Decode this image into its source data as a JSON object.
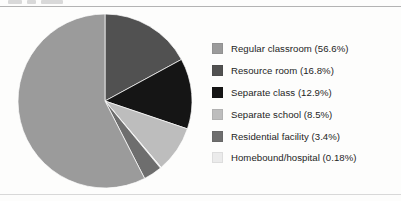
{
  "figure": {
    "background_color": "#fdfdfc",
    "rule_color": "#b3b3b3"
  },
  "chart_data": {
    "type": "pie",
    "title": "",
    "subtitle": "",
    "xlabel": "",
    "ylabel": "",
    "grid": false,
    "legend_position": "right",
    "start_angle_deg": 0,
    "direction": "clockwise",
    "categories": [
      "Regular classroom",
      "Resource room",
      "Separate class",
      "Separate school",
      "Residential facility",
      "Homebound/hospital"
    ],
    "values": [
      56.6,
      16.8,
      12.9,
      8.5,
      3.4,
      0.18
    ],
    "value_unit": "%",
    "colors": [
      "#9b9b9b",
      "#515151",
      "#151515",
      "#bdbdbd",
      "#6e6e6e",
      "#ebebeb"
    ],
    "slices": [
      {
        "label": "Regular classroom",
        "value": 56.6,
        "display": "56.6%",
        "color": "#9b9b9b",
        "draw_order": 6
      },
      {
        "label": "Resource room",
        "value": 16.8,
        "display": "16.8%",
        "color": "#515151",
        "draw_order": 1
      },
      {
        "label": "Separate class",
        "value": 12.9,
        "display": "12.9%",
        "color": "#151515",
        "draw_order": 2
      },
      {
        "label": "Separate school",
        "value": 8.5,
        "display": "8.5%",
        "color": "#bdbdbd",
        "draw_order": 3
      },
      {
        "label": "Homebound/hospital",
        "value": 0.18,
        "display": "0.18%",
        "color": "#ebebeb",
        "draw_order": 4
      },
      {
        "label": "Residential facility",
        "value": 3.4,
        "display": "3.4%",
        "color": "#6e6e6e",
        "draw_order": 5
      }
    ]
  },
  "legend": {
    "items": [
      {
        "label": "Regular classroom (56.6%)",
        "color": "#9b9b9b"
      },
      {
        "label": "Resource room (16.8%)",
        "color": "#515151"
      },
      {
        "label": "Separate class (12.9%)",
        "color": "#151515"
      },
      {
        "label": "Separate school (8.5%)",
        "color": "#bdbdbd"
      },
      {
        "label": "Residential facility (3.4%)",
        "color": "#6e6e6e"
      },
      {
        "label": "Homebound/hospital (0.18%)",
        "color": "#ebebeb"
      }
    ]
  }
}
